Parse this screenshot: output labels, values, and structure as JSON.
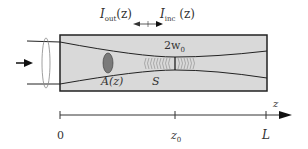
{
  "labels": {
    "i_out_main": "I",
    "i_out_sub": "out",
    "i_out_arg": "(z)",
    "i_inc_main": "I",
    "i_inc_sub": "inc",
    "i_inc_arg": "(z)",
    "waist": "2w",
    "waist_sub": "0",
    "area": "A(z)",
    "surface": "S",
    "axis": "z",
    "tick_0": "0",
    "tick_z0": "z",
    "tick_z0_sub": "0",
    "tick_L": "L"
  },
  "colors": {
    "medium_fill": "#d9d9d9",
    "outline": "#222222",
    "cross_section": "#7a7a7a",
    "arrow": "#111111"
  }
}
